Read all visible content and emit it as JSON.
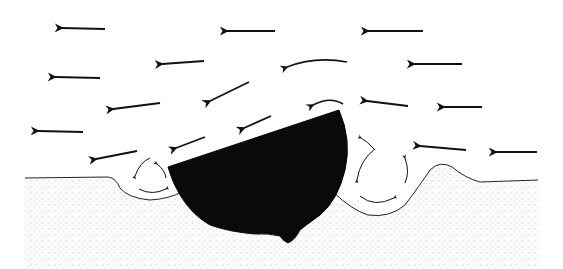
{
  "diagram": {
    "title": "Wind flow around a partially buried object with scour hollows",
    "colors": {
      "background": "#ffffff",
      "ink": "#111111",
      "object": "#0a0a0a",
      "sand_stipple": "#555555"
    },
    "wind_arrows": [
      {
        "x1": 105,
        "y1": 29,
        "x2": 62,
        "y2": 28
      },
      {
        "x1": 275,
        "y1": 31,
        "x2": 227,
        "y2": 31
      },
      {
        "x1": 423,
        "y1": 31,
        "x2": 368,
        "y2": 31
      },
      {
        "x1": 204,
        "y1": 61,
        "x2": 162,
        "y2": 64
      },
      {
        "x1": 100,
        "y1": 78,
        "x2": 55,
        "y2": 77
      },
      {
        "x1": 462,
        "y1": 64,
        "x2": 414,
        "y2": 64
      },
      {
        "x1": 160,
        "y1": 103,
        "x2": 113,
        "y2": 109
      },
      {
        "x1": 249,
        "y1": 82,
        "x2": 210,
        "y2": 101
      },
      {
        "x1": 482,
        "y1": 107,
        "x2": 444,
        "y2": 107
      },
      {
        "x1": 408,
        "y1": 106,
        "x2": 367,
        "y2": 101
      },
      {
        "x1": 83,
        "y1": 132,
        "x2": 38,
        "y2": 131
      },
      {
        "x1": 271,
        "y1": 116,
        "x2": 244,
        "y2": 128
      },
      {
        "x1": 205,
        "y1": 137,
        "x2": 176,
        "y2": 148
      },
      {
        "x1": 466,
        "y1": 150,
        "x2": 420,
        "y2": 146
      },
      {
        "x1": 537,
        "y1": 152,
        "x2": 496,
        "y2": 152
      },
      {
        "x1": 137,
        "y1": 151,
        "x2": 96,
        "y2": 159
      }
    ],
    "curved_arrows": [
      {
        "d": "M 347 62 Q 315 56 287 67"
      },
      {
        "d": "M 343 104 Q 330 96 313 105"
      },
      {
        "d": "M 150 158 Q 140 162 135 176"
      },
      {
        "d": "M 166 178 Q 165 170 157 164"
      },
      {
        "d": "M 139 189 Q 152 196 166 189"
      },
      {
        "d": "M 375 149 Q 360 160 357 180"
      },
      {
        "d": "M 374 149 Q 368 142 361 138"
      },
      {
        "d": "M 405 183 Q 410 172 405 158"
      },
      {
        "d": "M 360 196 Q 374 208 394 198"
      }
    ],
    "labels": {
      "object": "partially buried object (boulder)",
      "ground": "sand surface",
      "flow": "wind direction (right to left)",
      "upwind_scour": "upwind scour hollow with reverse eddy",
      "downwind_scour": "downwind scour hollow with eddies"
    }
  }
}
